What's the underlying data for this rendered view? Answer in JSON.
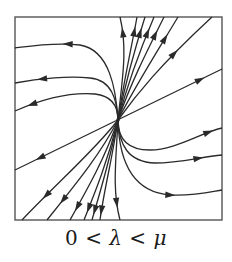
{
  "figure": {
    "type": "phase-portrait",
    "caption": {
      "zero": "0",
      "lt1": " < ",
      "lambda": "λ",
      "lt2": " < ",
      "mu": "μ"
    },
    "colors": {
      "stroke": "#2a2a2a",
      "frame": "#555555",
      "background": "#ffffff"
    },
    "frame": {
      "x": 15,
      "y": 17,
      "width": 207,
      "height": 203
    },
    "origin": {
      "x": 118,
      "y": 120
    },
    "trajectories": [
      {
        "id": "eigen-line",
        "path": "M15,170 L222,69",
        "arrows": [
          {
            "x": 40,
            "y": 158,
            "dir": "left"
          },
          {
            "x": 200,
            "y": 80,
            "dir": "right"
          }
        ]
      },
      {
        "id": "upper-left-1",
        "path": "M118,120 C116,90 110,50 80,45 C55,42 30,46 15,48",
        "arrows": [
          {
            "x": 68,
            "y": 44,
            "dir": "left"
          }
        ]
      },
      {
        "id": "upper-left-2",
        "path": "M118,120 C117,100 112,80 90,78 C70,76 40,78 15,83",
        "arrows": [
          {
            "x": 42,
            "y": 79,
            "dir": "left"
          }
        ]
      },
      {
        "id": "upper-left-3",
        "path": "M118,120 C118,108 113,96 95,94 C70,92 40,100 15,111",
        "arrows": [
          {
            "x": 32,
            "y": 104,
            "dir": "left"
          }
        ]
      },
      {
        "id": "lower-right-1",
        "path": "M118,120 C118,138 126,150 150,150 C175,150 200,133 222,128",
        "arrows": [
          {
            "x": 208,
            "y": 130,
            "dir": "right"
          }
        ]
      },
      {
        "id": "lower-right-2",
        "path": "M118,120 C119,145 128,162 155,163 C180,163 200,157 222,155",
        "arrows": [
          {
            "x": 198,
            "y": 157,
            "dir": "right"
          }
        ]
      },
      {
        "id": "lower-right-3",
        "path": "M118,120 C119,160 132,192 170,195 C195,196 210,192 222,190",
        "arrows": [
          {
            "x": 170,
            "y": 195,
            "dir": "right"
          }
        ]
      },
      {
        "id": "top-1",
        "path": "M118,120 C122,80 128,50 120,17",
        "arrows": [
          {
            "x": 122,
            "y": 32,
            "dir": "up"
          }
        ]
      },
      {
        "id": "top-2",
        "path": "M118,120 C124,80 132,45 137,17",
        "arrows": [
          {
            "x": 135,
            "y": 32,
            "dir": "up"
          }
        ]
      },
      {
        "id": "top-3",
        "path": "M118,120 C126,80 136,45 145,17",
        "arrows": [
          {
            "x": 142,
            "y": 33,
            "dir": "up"
          }
        ]
      },
      {
        "id": "top-4",
        "path": "M118,120 C128,82 140,50 154,17",
        "arrows": [
          {
            "x": 151,
            "y": 34,
            "dir": "up"
          }
        ]
      },
      {
        "id": "top-5",
        "path": "M118,120 C130,85 145,55 164,17",
        "arrows": [
          {
            "x": 160,
            "y": 37,
            "dir": "up"
          }
        ]
      },
      {
        "id": "top-6",
        "path": "M118,120 C133,90 152,60 178,17",
        "arrows": [
          {
            "x": 170,
            "y": 42,
            "dir": "up"
          }
        ]
      },
      {
        "id": "top-7",
        "path": "M118,120 C136,95 160,65 212,17",
        "arrows": [
          {
            "x": 175,
            "y": 55,
            "dir": "up"
          }
        ]
      },
      {
        "id": "bottom-1",
        "path": "M118,120 C116,160 112,190 120,220",
        "arrows": [
          {
            "x": 118,
            "y": 203,
            "dir": "down"
          }
        ]
      },
      {
        "id": "bottom-2",
        "path": "M118,120 C112,160 104,190 100,220",
        "arrows": [
          {
            "x": 101,
            "y": 210,
            "dir": "down"
          }
        ]
      },
      {
        "id": "bottom-3",
        "path": "M118,120 C110,160 100,192 92,220",
        "arrows": [
          {
            "x": 94,
            "y": 210,
            "dir": "down"
          }
        ]
      },
      {
        "id": "bottom-4",
        "path": "M118,120 C108,160 96,190 84,220",
        "arrows": [
          {
            "x": 87,
            "y": 208,
            "dir": "down"
          }
        ]
      },
      {
        "id": "bottom-5",
        "path": "M118,120 C105,158 88,188 70,220",
        "arrows": [
          {
            "x": 75,
            "y": 206,
            "dir": "down"
          }
        ]
      },
      {
        "id": "bottom-6",
        "path": "M118,120 C100,155 75,185 47,220",
        "arrows": [
          {
            "x": 62,
            "y": 199,
            "dir": "down"
          }
        ]
      },
      {
        "id": "bottom-7",
        "path": "M118,120 C95,150 60,180 22,220",
        "arrows": [
          {
            "x": 45,
            "y": 194,
            "dir": "down"
          }
        ]
      }
    ]
  }
}
